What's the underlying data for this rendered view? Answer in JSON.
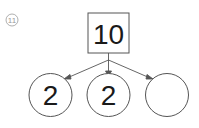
{
  "problem": {
    "number_label": "11",
    "whole": {
      "value": "10"
    },
    "parts": [
      {
        "value": "2"
      },
      {
        "value": "2"
      },
      {
        "value": ""
      }
    ]
  },
  "colors": {
    "stroke": "#555555",
    "text": "#1a1a1a",
    "number_badge": "#9a9a9a"
  }
}
